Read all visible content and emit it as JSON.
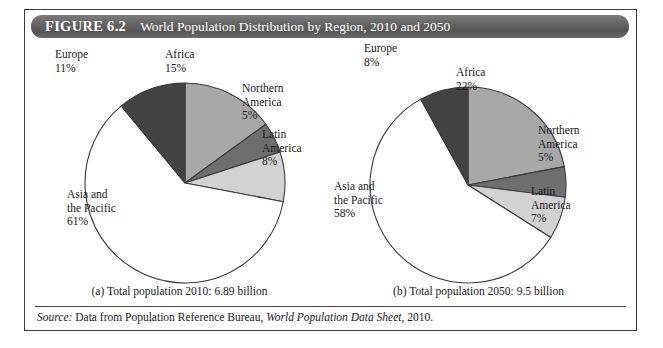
{
  "figure": {
    "number_label": "FIGURE 6.2",
    "title": "World Population Distribution by Region, 2010 and 2050",
    "source_prefix": "Source:",
    "source_text_1": " Data from Population Reference Bureau, ",
    "source_italic": "World Population Data Sheet",
    "source_text_2": ", 2010."
  },
  "palette": {
    "africa": "#a8a8a8",
    "northern_america": "#6e6e6e",
    "latin_america": "#d2d2d2",
    "asia_pacific": "#ffffff",
    "europe": "#434343",
    "outline": "#3a3a3a",
    "title_bar": "#5f5f5f"
  },
  "chart_data": [
    {
      "type": "pie",
      "id": "pie-2010",
      "title": "(a) Total population 2010: 6.89 billion",
      "caption": "(a) Total population 2010: 6.89 billion",
      "total_population": "6.89 billion",
      "year": "2010",
      "unit": "percent",
      "categories": [
        "Africa",
        "Northern America",
        "Latin America",
        "Asia and the Pacific",
        "Europe"
      ],
      "values": [
        15,
        5,
        8,
        61,
        11
      ],
      "labels": [
        {
          "name": "Africa",
          "pct": "15%",
          "value": 15,
          "color": "#a8a8a8"
        },
        {
          "name": "Northern\nAmerica",
          "pct": "5%",
          "value": 5,
          "color": "#6e6e6e"
        },
        {
          "name": "Latin\nAmerica",
          "pct": "8%",
          "value": 8,
          "color": "#d2d2d2"
        },
        {
          "name": "Asia and\nthe Pacific",
          "pct": "61%",
          "value": 61,
          "color": "#ffffff"
        },
        {
          "name": "Europe",
          "pct": "11%",
          "value": 11,
          "color": "#434343"
        }
      ],
      "legend": "none",
      "start_angle_deg": 0,
      "direction": "clockwise"
    },
    {
      "type": "pie",
      "id": "pie-2050",
      "title": "(b) Total population 2050: 9.5 billion",
      "caption": "(b) Total population 2050: 9.5 billion",
      "total_population": "9.5 billion",
      "year": "2050",
      "unit": "percent",
      "categories": [
        "Africa",
        "Northern America",
        "Latin America",
        "Asia and the Pacific",
        "Europe"
      ],
      "values": [
        22,
        5,
        7,
        58,
        8
      ],
      "labels": [
        {
          "name": "Africa",
          "pct": "22%",
          "value": 22,
          "color": "#a8a8a8"
        },
        {
          "name": "Northern\nAmerica",
          "pct": "5%",
          "value": 5,
          "color": "#6e6e6e"
        },
        {
          "name": "Latin\nAmerica",
          "pct": "7%",
          "value": 7,
          "color": "#d2d2d2"
        },
        {
          "name": "Asia and\nthe Pacific",
          "pct": "58%",
          "value": 58,
          "color": "#ffffff"
        },
        {
          "name": "Europe",
          "pct": "8%",
          "value": 8,
          "color": "#434343"
        }
      ],
      "legend": "none",
      "start_angle_deg": 0,
      "direction": "clockwise"
    }
  ],
  "label_positions": {
    "pie-2010": {
      "Africa": {
        "x": 138,
        "y": 8,
        "align": "left"
      },
      "Northern America": {
        "x": 215,
        "y": 42,
        "align": "left"
      },
      "Latin America": {
        "x": 235,
        "y": 88,
        "align": "left"
      },
      "Asia and the Pacific": {
        "x": 40,
        "y": 148,
        "align": "left"
      },
      "Europe": {
        "x": 28,
        "y": 8,
        "align": "left"
      }
    },
    "pie-2050": {
      "Africa": {
        "x": 130,
        "y": 26,
        "align": "left"
      },
      "Northern America": {
        "x": 212,
        "y": 84,
        "align": "left"
      },
      "Latin America": {
        "x": 205,
        "y": 145,
        "align": "left"
      },
      "Asia and the Pacific": {
        "x": 8,
        "y": 140,
        "align": "left"
      },
      "Europe": {
        "x": 38,
        "y": 2,
        "align": "left"
      }
    }
  }
}
